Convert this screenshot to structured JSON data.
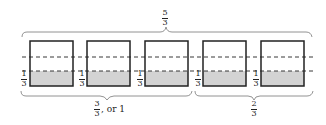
{
  "diagram": {
    "top_label": {
      "numerator": "5",
      "denominator": "3"
    },
    "boxes": [
      {
        "label_num": "1",
        "label_den": "3",
        "shaded_fraction": "1/3"
      },
      {
        "label_num": "1",
        "label_den": "3",
        "shaded_fraction": "1/3"
      },
      {
        "label_num": "1",
        "label_den": "3",
        "shaded_fraction": "1/3"
      },
      {
        "label_num": "1",
        "label_den": "3",
        "shaded_fraction": "1/3"
      },
      {
        "label_num": "1",
        "label_den": "3",
        "shaded_fraction": "1/3"
      }
    ],
    "bottom_left": {
      "numerator": "3",
      "denominator": "3",
      "suffix": ", or 1"
    },
    "bottom_right": {
      "numerator": "2",
      "denominator": "3"
    },
    "colors": {
      "shade": "#d3d3d3",
      "stroke": "#222222"
    }
  }
}
